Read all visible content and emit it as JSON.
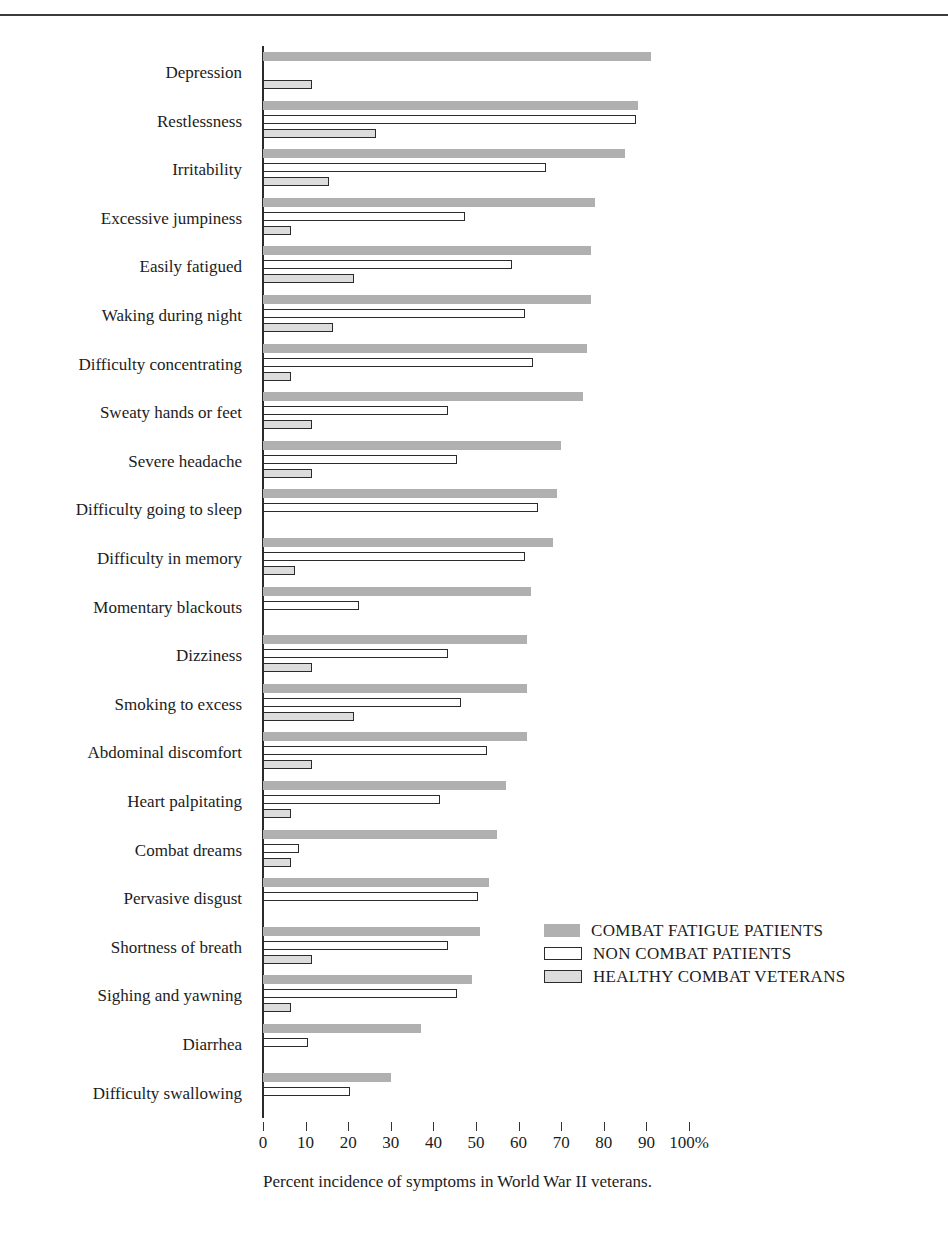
{
  "header": {
    "cropped_text": ""
  },
  "chart_data": {
    "type": "bar",
    "orientation": "horizontal",
    "title": "",
    "caption": "Percent incidence of symptoms in World War II veterans.",
    "xlabel": "",
    "ylabel": "",
    "xlim": [
      0,
      100
    ],
    "xticks": [
      0,
      10,
      20,
      30,
      40,
      50,
      60,
      70,
      80,
      90,
      100
    ],
    "xticklabels": [
      "0",
      "10",
      "20",
      "30",
      "40",
      "50",
      "60",
      "70",
      "80",
      "90",
      "100%"
    ],
    "grid": false,
    "legend_position": "center-right",
    "legend": [
      {
        "name": "COMBAT FATIGUE PATIENTS",
        "key": "cfp",
        "color": "#b0b0b0",
        "style": "filled-gray"
      },
      {
        "name": "NON COMBAT PATIENTS",
        "key": "ncp",
        "color": "#ffffff",
        "style": "outlined-white"
      },
      {
        "name": "HEALTHY COMBAT VETERANS",
        "key": "hcv",
        "color": "#dcdcdc",
        "style": "outlined-light-gray"
      }
    ],
    "categories": [
      "Depression",
      "Restlessness",
      "Irritability",
      "Excessive jumpiness",
      "Easily fatigued",
      "Waking during night",
      "Difficulty concentrating",
      "Sweaty hands or feet",
      "Severe headache",
      "Difficulty going to sleep",
      "Difficulty in memory",
      "Momentary blackouts",
      "Dizziness",
      "Smoking to excess",
      "Abdominal discomfort",
      "Heart palpitating",
      "Combat dreams",
      "Pervasive disgust",
      "Shortness of breath",
      "Sighing and yawning",
      "Diarrhea",
      "Difficulty swallowing"
    ],
    "series": [
      {
        "name": "COMBAT FATIGUE PATIENTS",
        "key": "cfp",
        "values": [
          91,
          88,
          85,
          78,
          77,
          77,
          76,
          75,
          70,
          69,
          68,
          63,
          62,
          62,
          62,
          57,
          55,
          53,
          51,
          49,
          37,
          30
        ]
      },
      {
        "name": "NON COMBAT PATIENTS",
        "key": "ncp",
        "values": [
          0,
          87,
          66,
          47,
          58,
          61,
          63,
          43,
          45,
          64,
          61,
          22,
          43,
          46,
          52,
          41,
          8,
          50,
          43,
          45,
          10,
          20
        ]
      },
      {
        "name": "HEALTHY COMBAT VETERANS",
        "key": "hcv",
        "values": [
          11,
          26,
          15,
          6,
          21,
          16,
          6,
          11,
          11,
          0,
          7,
          0,
          11,
          21,
          11,
          6,
          6,
          0,
          11,
          6,
          0,
          0
        ]
      }
    ]
  }
}
